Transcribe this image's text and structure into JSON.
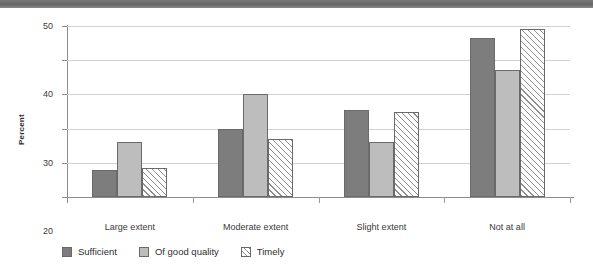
{
  "chart_data": {
    "type": "bar",
    "title": "",
    "subtitle": "",
    "xlabel": "",
    "ylabel": "Percent",
    "ylim": [
      0,
      50
    ],
    "yticks": [
      0,
      10,
      20,
      30,
      40,
      50
    ],
    "ytick_labels": [
      "0",
      "10",
      "20",
      "30",
      "40",
      "50"
    ],
    "grid": true,
    "legend_position": "bottom-left",
    "categories": [
      "Large extent",
      "Moderate extent",
      "Slight extent",
      "Not at all"
    ],
    "series": [
      {
        "name": "Sufficient",
        "color": "#7d7d7d",
        "fill": "solid",
        "values": [
          8.0,
          20.0,
          25.3,
          46.5
        ]
      },
      {
        "name": "Of good quality",
        "color": "#bdbdbd",
        "fill": "solid",
        "values": [
          16.2,
          30.0,
          16.0,
          37.0
        ]
      },
      {
        "name": "Timely",
        "color": "#ffffff",
        "fill": "hatched-45",
        "values": [
          8.5,
          17.0,
          24.8,
          49.2
        ]
      }
    ]
  },
  "figure": {
    "top_band_color": "#6e6e6e",
    "axis_color": "#8c8c8c",
    "grid_color": "#d2d2d2",
    "background": "#ffffff"
  }
}
